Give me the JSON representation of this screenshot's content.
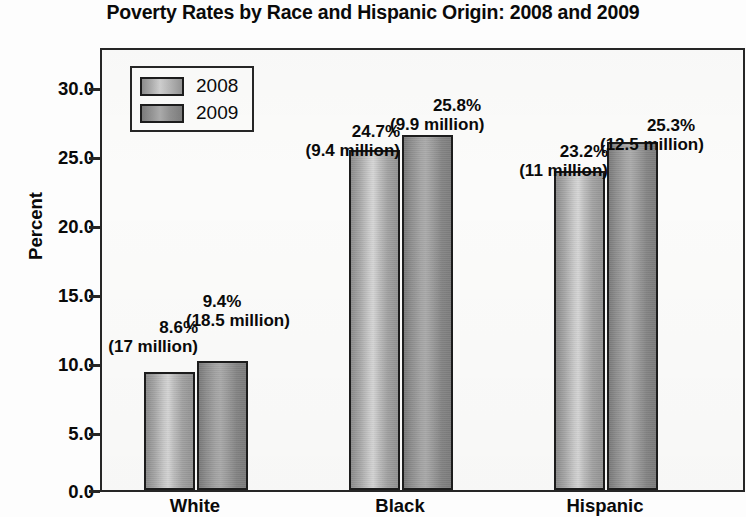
{
  "chart_data": {
    "type": "bar",
    "title": "Poverty Rates by Race and Hispanic Origin: 2008 and 2009",
    "xlabel": "",
    "ylabel": "Percent",
    "ylim": [
      0.0,
      32.0
    ],
    "yticks": [
      "0.0",
      "5.0",
      "10.0",
      "15.0",
      "20.0",
      "25.0",
      "30.0"
    ],
    "ytick_values": [
      0.0,
      5.0,
      10.0,
      15.0,
      20.0,
      25.0,
      30.0
    ],
    "grid": false,
    "legend_position": "upper-left-inside",
    "categories": [
      "White",
      "Black",
      "Hispanic"
    ],
    "series": [
      {
        "name": "2008",
        "values": [
          8.6,
          24.7,
          23.2
        ],
        "labels_pct": [
          "8.6%",
          "24.7%",
          "23.2%"
        ],
        "labels_count": [
          "(17 million)",
          "(9.4 million)",
          "(11 million)"
        ]
      },
      {
        "name": "2009",
        "values": [
          9.4,
          25.8,
          25.3
        ],
        "labels_pct": [
          "9.4%",
          "25.8%",
          "25.3%"
        ],
        "labels_count": [
          "(18.5 million)",
          "(9.9 million)",
          "(12.5 million)"
        ]
      }
    ],
    "colors": {
      "series_2008": "#c9c9c9",
      "series_2009": "#9a9a9a",
      "axis": "#262626",
      "text": "#0a0a0a",
      "plot_background": "#fbfbfa"
    }
  },
  "legend": {
    "items": [
      {
        "label": "2008"
      },
      {
        "label": "2009"
      }
    ]
  },
  "axis": {
    "y_title": "Percent",
    "y_labels": [
      "30.0",
      "25.0",
      "20.0",
      "15.0",
      "10.0",
      "5.0",
      "0.0"
    ],
    "x_labels": [
      "White",
      "Black",
      "Hispanic"
    ]
  },
  "labels": {
    "white_2008_pct": "8.6%",
    "white_2008_cnt": "(17 million)",
    "white_2009_pct": "9.4%",
    "white_2009_cnt": "(18.5 million)",
    "black_2008_pct": "24.7%",
    "black_2008_cnt": "(9.4 million)",
    "black_2009_pct": "25.8%",
    "black_2009_cnt": "(9.9 million)",
    "hispanic_2008_pct": "23.2%",
    "hispanic_2008_cnt": "(11 million)",
    "hispanic_2009_pct": "25.3%",
    "hispanic_2009_cnt": "(12.5 million)"
  }
}
